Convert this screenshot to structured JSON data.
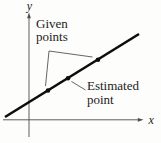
{
  "figure": {
    "type": "line-diagram",
    "axis": {
      "x_label": "x",
      "y_label": "y"
    },
    "annotations": {
      "given": {
        "line1": "Given",
        "line2": "points"
      },
      "estimated": {
        "line1": "Estimated",
        "line2": "point"
      }
    },
    "line": {
      "x1": 5,
      "y1": 117,
      "x2": 139,
      "y2": 34
    },
    "points": {
      "given": [
        {
          "x": 48,
          "y": 90.5
        },
        {
          "x": 98,
          "y": 59.7
        }
      ],
      "estimated": [
        {
          "x": 68,
          "y": 78.2
        }
      ]
    },
    "marker_radius": 2.3,
    "colors": {
      "background": "#fdfdfb",
      "axis": "#4d4d4d",
      "line": "#0d0d0d",
      "point": "#0d0d0d",
      "leader": "#3f3f3f",
      "text": "#1c1c1c"
    }
  }
}
